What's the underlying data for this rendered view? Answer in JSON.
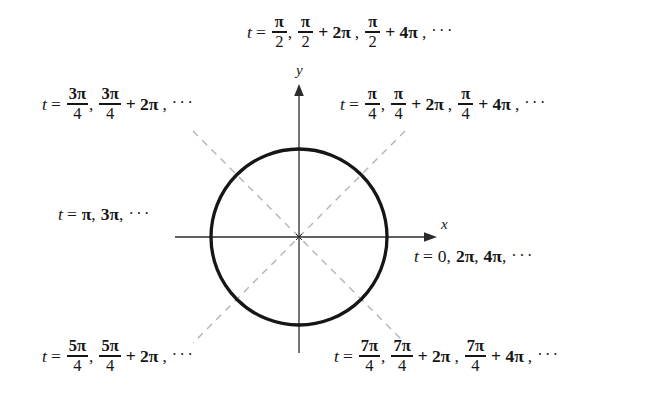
{
  "figure": {
    "name": "unit-circle-parameter-values",
    "background_color": "#ffffff",
    "ink_color": "#161616",
    "dashed_color": "#b0b0b0",
    "circle": {
      "center_x": 299,
      "center_y": 237,
      "radius": 88,
      "stroke_width": 3.2
    },
    "axes": {
      "x": {
        "x_start": 175,
        "x_end": 432,
        "y": 237,
        "label": "x",
        "arrow": "right"
      },
      "y": {
        "y_start": 88,
        "y_end": 353,
        "x": 299,
        "label": "y",
        "arrow": "up"
      },
      "stroke_width": 1.2
    },
    "dashed_diagonals": [
      {
        "name": "diagonal-45",
        "x1": 193,
        "y1": 131,
        "x2": 405,
        "y2": 343
      },
      {
        "name": "diagonal-135",
        "x1": 405,
        "y1": 131,
        "x2": 193,
        "y2": 343
      }
    ]
  },
  "labels": {
    "top": {
      "name": "label-pi-over-2",
      "angle_position": "top",
      "text": "t = π/2, π/2 + 2π, π/2 + 4π, ⋯",
      "variable": "t",
      "equals": "=",
      "terms": [
        {
          "numerator": "π",
          "denominator": "2",
          "offset": ""
        },
        {
          "numerator": "π",
          "denominator": "2",
          "offset": "+ 2π"
        },
        {
          "numerator": "π",
          "denominator": "2",
          "offset": "+ 4π"
        }
      ],
      "ellipsis": "···"
    },
    "upper_left": {
      "name": "label-3pi-over-4",
      "angle_position": "upper-left",
      "text": "t = 3π/4, 3π/4 + 2π, ⋯",
      "variable": "t",
      "equals": "=",
      "terms": [
        {
          "numerator": "3π",
          "denominator": "4",
          "offset": ""
        },
        {
          "numerator": "3π",
          "denominator": "4",
          "offset": "+ 2π"
        }
      ],
      "ellipsis": "···"
    },
    "upper_right": {
      "name": "label-pi-over-4",
      "angle_position": "upper-right",
      "text": "t = π/4, π/4 + 2π, π/4 + 4π, ⋯",
      "variable": "t",
      "equals": "=",
      "terms": [
        {
          "numerator": "π",
          "denominator": "4",
          "offset": ""
        },
        {
          "numerator": "π",
          "denominator": "4",
          "offset": "+ 2π"
        },
        {
          "numerator": "π",
          "denominator": "4",
          "offset": "+ 4π"
        }
      ],
      "ellipsis": "···"
    },
    "left": {
      "name": "label-pi",
      "angle_position": "left",
      "text": "t = π, 3π, ⋯",
      "variable": "t",
      "equals": "=",
      "first": "π",
      "second": "3π",
      "ellipsis": "···"
    },
    "right": {
      "name": "label-zero",
      "angle_position": "right",
      "text": "t = 0, 2π, 4π, ⋯",
      "variable": "t",
      "equals": "=",
      "first": "0",
      "second": "2π",
      "third": "4π",
      "ellipsis": "···"
    },
    "lower_left": {
      "name": "label-5pi-over-4",
      "angle_position": "lower-left",
      "text": "t = 5π/4, 5π/4 + 2π, ⋯",
      "variable": "t",
      "equals": "=",
      "terms": [
        {
          "numerator": "5π",
          "denominator": "4",
          "offset": ""
        },
        {
          "numerator": "5π",
          "denominator": "4",
          "offset": "+ 2π"
        }
      ],
      "ellipsis": "···"
    },
    "lower_right": {
      "name": "label-7pi-over-4",
      "angle_position": "lower-right",
      "text": "t = 7π/4, 7π/4 + 2π, 7π/4 + 4π, ⋯",
      "variable": "t",
      "equals": "=",
      "terms": [
        {
          "numerator": "7π",
          "denominator": "4",
          "offset": ""
        },
        {
          "numerator": "7π",
          "denominator": "4",
          "offset": "+ 2π"
        },
        {
          "numerator": "7π",
          "denominator": "4",
          "offset": "+ 4π"
        }
      ],
      "ellipsis": "···"
    }
  },
  "axis_labels": {
    "x": "x",
    "y": "y"
  },
  "symbols": {
    "comma": ",",
    "plus": "+"
  }
}
